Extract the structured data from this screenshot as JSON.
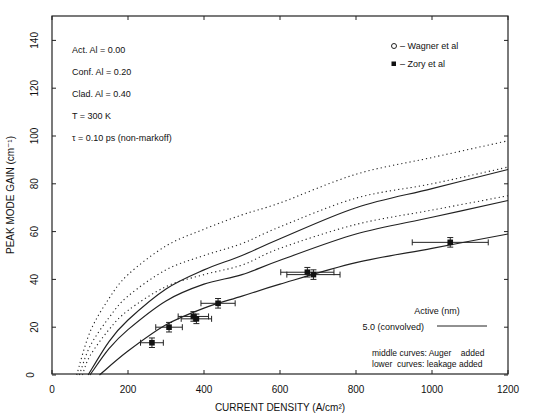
{
  "chart_data": {
    "type": "line",
    "title": "",
    "xlabel": "CURRENT DENSITY (A/cm²)",
    "ylabel": "PEAK MODE GAIN (cm⁻¹)",
    "xlim": [
      0,
      1200
    ],
    "ylim": [
      0,
      150
    ],
    "xticks": [
      0,
      200,
      400,
      600,
      800,
      1000,
      1200
    ],
    "yticks": [
      0,
      20,
      40,
      60,
      80,
      100,
      120,
      140
    ],
    "grid": false,
    "annotations": [
      "Act.  Al = 0.00",
      "Conf.  Al = 0.20",
      "Clad.  Al = 0.40",
      "T = 300 K",
      "τ = 0.10 ps (non-markoff)"
    ],
    "legend": {
      "markers": [
        {
          "symbol": "o",
          "label": "Wagner et al"
        },
        {
          "symbol": "■",
          "label": "Zory et al"
        }
      ],
      "lines_title": "Active (nm)",
      "lines": [
        {
          "label": "5.0 (convolved)",
          "style": "solid"
        }
      ],
      "notes": [
        "middle curves: Auger    added",
        "lower  curves: leakage added"
      ]
    },
    "series": [
      {
        "name": "dotted upper",
        "style": "dotted",
        "x": [
          65,
          100,
          150,
          200,
          300,
          400,
          500,
          600,
          800,
          1000,
          1200
        ],
        "y": [
          0,
          18,
          32,
          42,
          54,
          61,
          67,
          72,
          84,
          91,
          98
        ]
      },
      {
        "name": "dotted middle",
        "style": "dotted",
        "x": [
          72,
          100,
          150,
          200,
          300,
          400,
          500,
          600,
          800,
          1000,
          1200
        ],
        "y": [
          0,
          12,
          24,
          33,
          44,
          50,
          55,
          62,
          74,
          80,
          87
        ]
      },
      {
        "name": "solid upper",
        "style": "solid",
        "x": [
          95,
          150,
          200,
          300,
          400,
          500,
          600,
          800,
          1000,
          1200
        ],
        "y": [
          0,
          14,
          23,
          36,
          44,
          50,
          57,
          70,
          78,
          86
        ]
      },
      {
        "name": "dotted lower",
        "style": "dotted",
        "x": [
          80,
          100,
          150,
          200,
          300,
          400,
          500,
          600,
          800,
          1000,
          1200
        ],
        "y": [
          0,
          8,
          19,
          27,
          37,
          42,
          46,
          53,
          63,
          69,
          75
        ]
      },
      {
        "name": "solid middle",
        "style": "solid",
        "x": [
          100,
          150,
          200,
          300,
          400,
          500,
          600,
          800,
          1000,
          1200
        ],
        "y": [
          0,
          11,
          19,
          31,
          38,
          42,
          48,
          59,
          66,
          73
        ]
      },
      {
        "name": "solid lower (leakage)",
        "style": "solid",
        "x": [
          125,
          200,
          300,
          400,
          500,
          600,
          800,
          1000,
          1200
        ],
        "y": [
          0,
          10,
          21,
          28,
          33,
          38,
          47,
          53,
          59
        ]
      }
    ],
    "points": [
      {
        "set": "Zory et al",
        "x": 263,
        "y": 13.5,
        "xerr": 30,
        "yerr": 2
      },
      {
        "set": "Zory et al",
        "x": 308,
        "y": 20,
        "xerr": 35,
        "yerr": 2
      },
      {
        "set": "Zory et al",
        "x": 372,
        "y": 24.5,
        "xerr": 40,
        "yerr": 2
      },
      {
        "set": "Zory et al",
        "x": 380,
        "y": 23.5,
        "xerr": 40,
        "yerr": 2
      },
      {
        "set": "Zory et al",
        "x": 437,
        "y": 30,
        "xerr": 45,
        "yerr": 2
      },
      {
        "set": "Zory et al",
        "x": 672,
        "y": 43,
        "xerr": 70,
        "yerr": 2
      },
      {
        "set": "Zory et al",
        "x": 688,
        "y": 42,
        "xerr": 70,
        "yerr": 2
      },
      {
        "set": "Zory et al",
        "x": 1048,
        "y": 55.5,
        "xerr": 100,
        "yerr": 2
      }
    ]
  }
}
